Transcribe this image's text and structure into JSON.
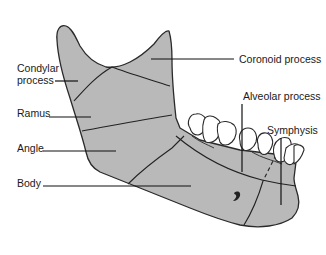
{
  "figure": {
    "colors": {
      "bone_fill": "#b9b9b9",
      "outline": "#2a2a2a",
      "teeth_fill": "#ffffff",
      "background": "#ffffff",
      "text": "#1a1a1a"
    }
  },
  "labels": {
    "condylar_line1": "Condylar",
    "condylar_line2": "process",
    "ramus": "Ramus",
    "angle": "Angle",
    "body": "Body",
    "coronoid": "Coronoid process",
    "alveolar": "Alveolar process",
    "symphysis": "Symphysis"
  }
}
